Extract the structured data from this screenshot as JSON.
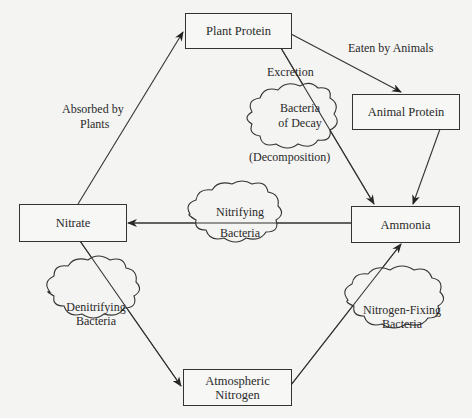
{
  "nodes": {
    "plant_protein": "Plant Protein",
    "animal_protein": "Animal Protein",
    "ammonia": "Ammonia",
    "nitrate": "Nitrate",
    "atmospheric_nitrogen_l1": "Atmospheric",
    "atmospheric_nitrogen_l2": "Nitrogen"
  },
  "edges": {
    "eaten_by_animals": "Eaten by Animals",
    "excretion": "Excretion",
    "absorbed_l1": "Absorbed by",
    "absorbed_l2": "Plants",
    "decomposition": "(Decomposition)"
  },
  "clouds": {
    "decay_l1": "Bacteria",
    "decay_l2": "of Decay",
    "nitrifying_l1": "Nitrifying",
    "nitrifying_l2": "Bacteria",
    "denitrifying_l1": "Denitrifying",
    "denitrifying_l2": "Bacteria",
    "fixing_l1": "Nitrogen-Fixing",
    "fixing_l2": "Bacteria"
  }
}
